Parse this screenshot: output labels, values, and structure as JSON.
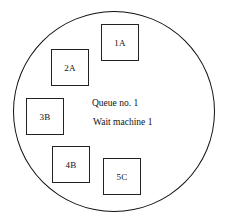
{
  "diagram": {
    "type": "queue-region",
    "shape": "circle",
    "queue_label": "Queue no. 1",
    "status_label": "Wait machine 1",
    "items": [
      {
        "id": "1A",
        "label": "1A"
      },
      {
        "id": "2A",
        "label": "2A"
      },
      {
        "id": "3B",
        "label": "3B"
      },
      {
        "id": "4B",
        "label": "4B"
      },
      {
        "id": "5C",
        "label": "5C"
      }
    ],
    "colors": {
      "line": "#111111",
      "background": "#ffffff"
    }
  }
}
